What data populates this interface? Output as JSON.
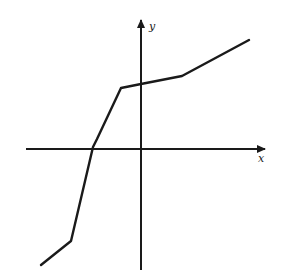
{
  "chart_data": {
    "type": "line",
    "title": "",
    "xlabel": "x",
    "ylabel": "y",
    "grid": false,
    "legend": null,
    "ticks": {
      "x": [],
      "y": []
    },
    "series": [
      {
        "name": "f(x)",
        "points_pixel": [
          [
            41,
            265
          ],
          [
            71,
            241
          ],
          [
            93,
            147
          ],
          [
            97,
            139
          ],
          [
            121,
            88
          ],
          [
            141,
            84
          ],
          [
            182,
            76
          ],
          [
            249,
            40
          ]
        ],
        "points_relative": [
          [
            -100,
            -116
          ],
          [
            -70,
            -92
          ],
          [
            -48,
            2
          ],
          [
            -44,
            10
          ],
          [
            -20,
            61
          ],
          [
            0,
            65
          ],
          [
            41,
            73
          ],
          [
            108,
            109
          ]
        ]
      }
    ],
    "axes": {
      "origin_pixel": [
        141,
        149
      ],
      "x_axis": {
        "from": [
          26,
          149
        ],
        "to": [
          265,
          149
        ]
      },
      "y_axis": {
        "from": [
          141,
          270
        ],
        "to": [
          141,
          20
        ]
      }
    },
    "colors": {
      "line": "#1a1a1a",
      "background": "#ffffff"
    }
  }
}
